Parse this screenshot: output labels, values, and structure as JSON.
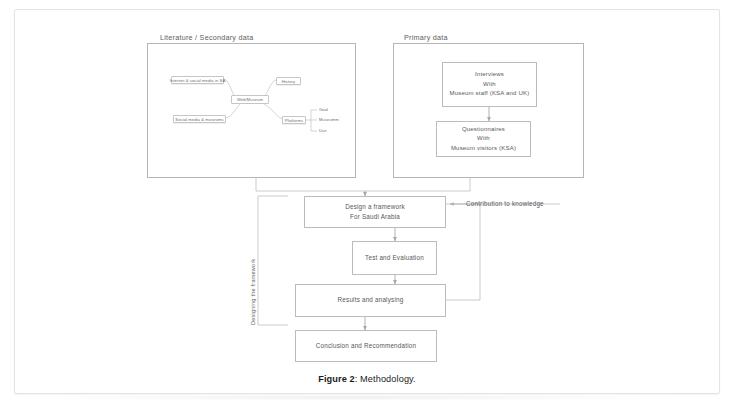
{
  "figure": {
    "caption_label": "Figure 2",
    "caption_sep": ": ",
    "caption_text": "Methodology."
  },
  "colors": {
    "page_background": "#ffffff",
    "page_border": "#e3e3e3",
    "box_border": "#bcbcbc",
    "container_border": "#b5b5b5",
    "text": "#585858",
    "caption_text": "#1c1c1c"
  },
  "containers": [
    {
      "id": "literature",
      "title": "Literature / Secondary data"
    },
    {
      "id": "primary",
      "title": "Primary data"
    }
  ],
  "mindmap": {
    "center": "Web/Museum",
    "nodes": [
      {
        "id": "internet-social-media",
        "label": "Internet & social media in SA"
      },
      {
        "id": "history",
        "label": "History"
      },
      {
        "id": "social-media-museums",
        "label": "Social media & museums"
      },
      {
        "id": "platforms",
        "label": "Platforms"
      }
    ],
    "platform_leaves": [
      {
        "id": "goal",
        "label": "Goal"
      },
      {
        "id": "museumm",
        "label": "Museumm"
      },
      {
        "id": "use",
        "label": "Use"
      }
    ]
  },
  "primary_data": {
    "interviews": {
      "line1": "Interviews",
      "line2": "With",
      "line3": "Museum staff (KSA and UK)"
    },
    "questionnaires": {
      "line1": "Questionnaires",
      "line2": "With",
      "line3": "Museum visitors (KSA)"
    }
  },
  "framework": {
    "section_label": "Designing the framework",
    "contribution_label": "Contribution to knowledge",
    "steps": [
      {
        "id": "design-framework",
        "line1": "Design a framework",
        "line2": "For Saudi Arabia"
      },
      {
        "id": "test-evaluation",
        "line1": "Test and Evaluation",
        "line2": ""
      },
      {
        "id": "results-analysing",
        "line1": "Results and analysing",
        "line2": ""
      },
      {
        "id": "conclusion-recommendation",
        "line1": "Conclusion and Recommendation",
        "line2": ""
      }
    ]
  }
}
